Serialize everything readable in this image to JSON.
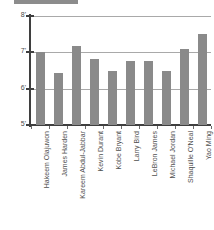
{
  "chart_data": {
    "type": "bar",
    "title": "",
    "subtitle": "",
    "xlabel": "",
    "ylabel": "",
    "categories": [
      "Hakeem Olajuwon",
      "James Harden",
      "Kareem Abdul-Jabbar",
      "Kevin Durant",
      "Kobe Bryant",
      "Larry Bird",
      "LeBron James",
      "Michael Jordan",
      "Shaquille O'Neal",
      "Yao Ming"
    ],
    "values": [
      7.0,
      6.42,
      7.17,
      6.83,
      6.5,
      6.75,
      6.75,
      6.5,
      7.08,
      7.5
    ],
    "value_labels": [
      "7'0\"",
      "6'5\"",
      "7'2\"",
      "6'10\"",
      "6'6\"",
      "6'9\"",
      "6'9\"",
      "6'6\"",
      "7'1\"",
      "7'6\""
    ],
    "ylim": [
      5,
      8
    ],
    "yticks": [
      5,
      6,
      7,
      8
    ],
    "ytick_labels": [
      "5'",
      "6'",
      "7'",
      "8'"
    ],
    "grid": true,
    "legend": false,
    "legend_position": "none",
    "bar_color": "#8a8a8a",
    "gridline_color": "#a9a9a9",
    "axis_color": "#3f3f3f",
    "background_color": "#ffffff"
  }
}
